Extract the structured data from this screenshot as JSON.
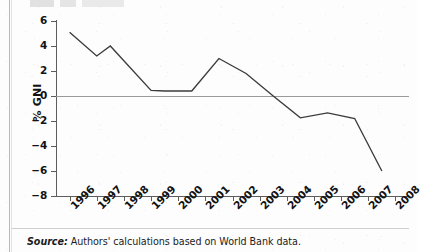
{
  "figure": {
    "source_caption": {
      "label": "Source:",
      "text": " Authors' calculations based on World Bank data."
    }
  },
  "chart_data": {
    "type": "line",
    "title": "",
    "subtitle": "",
    "xlabel": "",
    "ylabel": "% GNI",
    "xlim": [
      1995.5,
      2008.5
    ],
    "ylim": [
      -8,
      6
    ],
    "yticks": [
      6,
      4,
      2,
      0,
      -2,
      -4,
      -6,
      -8
    ],
    "ytick_labels": [
      "6",
      "4",
      "2",
      "0",
      "-2",
      "-4",
      "-6",
      "-8"
    ],
    "xticks": [
      1996,
      1997,
      1998,
      1999,
      2000,
      2001,
      2002,
      2003,
      2004,
      2005,
      2006,
      2007,
      2008
    ],
    "xtick_labels": [
      "1996",
      "1997",
      "1998",
      "1999",
      "2000",
      "2001",
      "2002",
      "2003",
      "2004",
      "2005",
      "2006",
      "2007",
      "2008"
    ],
    "grid": false,
    "legend": false,
    "zero_reference_line": 0,
    "line_color": "#3b3b3b",
    "zero_line_color": "#9a9a9a",
    "axis_color": "#5d5d5d",
    "series": [
      {
        "name": "% GNI",
        "x": [
          1996.0,
          1997.0,
          1997.5,
          1999.0,
          1999.5,
          2000.5,
          2001.5,
          2002.5,
          2003.5,
          2004.5,
          2005.5,
          2006.5,
          2007.5
        ],
        "values": [
          5.1,
          3.2,
          4.0,
          0.45,
          0.4,
          0.4,
          3.0,
          1.8,
          0.0,
          -1.75,
          -1.35,
          -1.8,
          -6.0
        ]
      }
    ]
  }
}
